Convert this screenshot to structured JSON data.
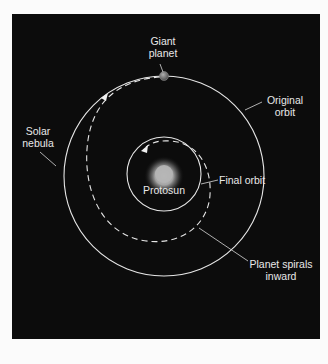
{
  "diagram": {
    "labels": {
      "giant_planet_1": "Giant",
      "giant_planet_2": "planet",
      "original_orbit_1": "Original",
      "original_orbit_2": "orbit",
      "solar_nebula_1": "Solar",
      "solar_nebula_2": "nebula",
      "final_orbit": "Final orbit",
      "protosun": "Protosun",
      "spiral_1": "Planet spirals",
      "spiral_2": "inward"
    },
    "colors": {
      "background": "#0c0c0c",
      "page": "#fbfbfb",
      "orbit_line": "#e6e6e6",
      "text": "#e8e8e8",
      "protosun_core": "#b8b8b8"
    }
  }
}
